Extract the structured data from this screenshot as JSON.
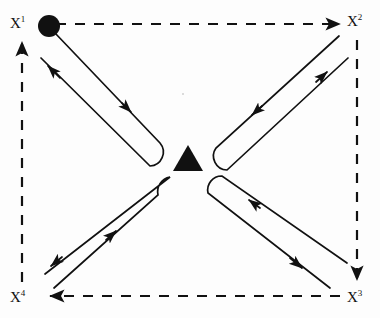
{
  "figure": {
    "background_color": "#fdfdfd",
    "stroke_color": "#111111",
    "nodes": [
      {
        "id": "x1",
        "label_base": "X",
        "label_sup": "1",
        "label": "X1",
        "position": "top-left",
        "x": 44,
        "y": 27,
        "marker": "filled-circle"
      },
      {
        "id": "x2",
        "label_base": "X",
        "label_sup": "2",
        "label": "X2",
        "position": "top-right",
        "x": 344,
        "y": 27,
        "marker": "none"
      },
      {
        "id": "x3",
        "label_base": "X",
        "label_sup": "3",
        "label": "X3",
        "position": "bottom-right",
        "x": 344,
        "y": 296,
        "marker": "none"
      },
      {
        "id": "x4",
        "label_base": "X",
        "label_sup": "4",
        "label": "X4",
        "position": "bottom-left",
        "x": 44,
        "y": 296,
        "marker": "none"
      }
    ],
    "center_marker": {
      "shape": "filled-triangle",
      "x": 188,
      "y": 158,
      "width": 28,
      "height": 24
    },
    "perimeter_edges": [
      {
        "id": "top",
        "from": "x1",
        "to": "x2",
        "style": "dashed",
        "arrow_at": "x2",
        "direction": "right"
      },
      {
        "id": "right",
        "from": "x2",
        "to": "x3",
        "style": "dashed",
        "arrow_at": "x3",
        "direction": "down"
      },
      {
        "id": "bottom",
        "from": "x3",
        "to": "x4",
        "style": "dashed",
        "arrow_at": "x4",
        "direction": "left"
      },
      {
        "id": "left",
        "from": "x4",
        "to": "x1",
        "style": "dashed",
        "arrow_at": "x1",
        "direction": "up"
      }
    ],
    "diagonal_loops": [
      {
        "id": "loop-x1",
        "corner": "top-left",
        "style": "solid",
        "outbound_direction": "toward-center",
        "return_direction": "toward-corner",
        "arrowheads": 2
      },
      {
        "id": "loop-x2",
        "corner": "top-right",
        "style": "solid",
        "outbound_direction": "toward-center",
        "return_direction": "toward-corner",
        "arrowheads": 2
      },
      {
        "id": "loop-x3",
        "corner": "bottom-right",
        "style": "solid",
        "outbound_direction": "toward-center",
        "return_direction": "toward-corner",
        "arrowheads": 2
      },
      {
        "id": "loop-x4",
        "corner": "bottom-left",
        "style": "solid",
        "outbound_direction": "toward-center",
        "return_direction": "toward-corner",
        "arrowheads": 2
      }
    ]
  }
}
